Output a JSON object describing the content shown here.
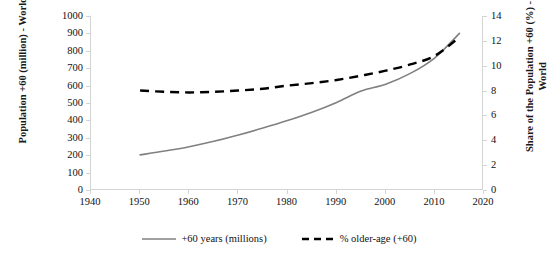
{
  "chart_data": {
    "type": "line",
    "title": "",
    "xlabel": "",
    "ylabel": "Population +60 (million) - World",
    "ylabel_secondary": "Share of the Population +60 (%) - World",
    "xlim": [
      1940,
      2020
    ],
    "ylim": [
      0,
      1000
    ],
    "ylim_secondary": [
      0,
      14
    ],
    "grid": false,
    "legend_position": "bottom",
    "xticks": [
      "1940",
      "1950",
      "1960",
      "1970",
      "1980",
      "1990",
      "2000",
      "2010",
      "2020"
    ],
    "yticks_left": [
      "0",
      "100",
      "200",
      "300",
      "400",
      "500",
      "600",
      "700",
      "800",
      "900",
      "1000"
    ],
    "yticks_right": [
      "0",
      "2",
      "4",
      "6",
      "8",
      "10",
      "12",
      "14"
    ],
    "x": [
      1950,
      1955,
      1960,
      1965,
      1970,
      1975,
      1980,
      1985,
      1990,
      1995,
      2000,
      2005,
      2010,
      2015
    ],
    "series": [
      {
        "name": "+60 years (millions)",
        "axis": "left",
        "style": "solid",
        "color": "#808080",
        "values": [
          202,
          224,
          249,
          280,
          316,
          356,
          399,
          447,
          503,
          569,
          608,
          670,
          760,
          900
        ]
      },
      {
        "name": "% older-age (+60)",
        "axis": "right",
        "style": "dashed",
        "color": "#000000",
        "values": [
          8.0,
          7.9,
          7.85,
          7.9,
          8.0,
          8.15,
          8.4,
          8.6,
          8.85,
          9.2,
          9.6,
          10.1,
          10.8,
          12.3
        ]
      }
    ]
  },
  "legend": {
    "items": [
      {
        "label": "+60 years (millions)",
        "style": "solid",
        "color": "#808080"
      },
      {
        "label": "% older-age (+60)",
        "style": "dashed",
        "color": "#000000"
      }
    ]
  },
  "axes": {
    "left_title": "Population +60 (million) - World",
    "right_title": "Share of the Population +60 (%) - World"
  }
}
